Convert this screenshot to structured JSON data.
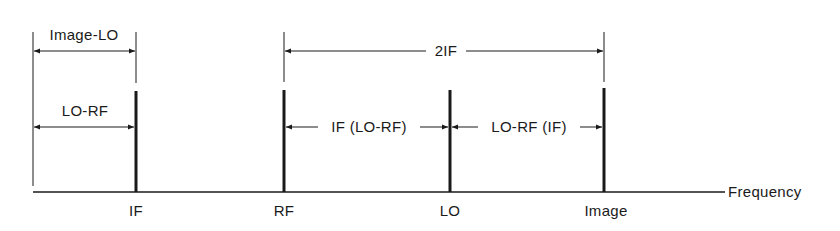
{
  "diagram": {
    "axis_label": "Frequency",
    "colors": {
      "ink": "#1a1a1a",
      "background": "#ffffff"
    },
    "signals": [
      {
        "id": "if",
        "label": "IF",
        "x": 136
      },
      {
        "id": "rf",
        "label": "RF",
        "x": 284
      },
      {
        "id": "lo",
        "label": "LO",
        "x": 450
      },
      {
        "id": "image",
        "label": "Image",
        "x": 604
      }
    ],
    "dimensions": [
      {
        "id": "image-lo",
        "label": "Image-LO",
        "from": "origin",
        "to": "IF"
      },
      {
        "id": "lo-rf-left",
        "label": "LO-RF",
        "from": "origin",
        "to": "IF"
      },
      {
        "id": "two-if",
        "label": "2IF",
        "from": "RF",
        "to": "Image"
      },
      {
        "id": "if-lo-rf",
        "label": "IF (LO-RF)",
        "from": "RF",
        "to": "LO"
      },
      {
        "id": "lo-rf-if",
        "label": "LO-RF (IF)",
        "from": "LO",
        "to": "Image"
      }
    ]
  }
}
